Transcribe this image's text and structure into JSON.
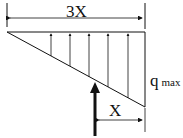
{
  "diagram": {
    "type": "triangular distributed load with resultant force",
    "labels": {
      "total_length": "3X",
      "resultant_offset": "X",
      "load_symbol": "q",
      "load_subscript": "max"
    },
    "distributed_arrows_count": 5,
    "colors": {
      "stroke": "#111111",
      "background": "#ffffff"
    }
  }
}
